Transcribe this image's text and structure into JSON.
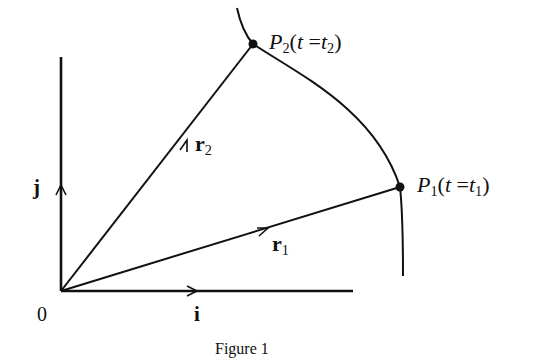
{
  "figure": {
    "caption": "Figure 1",
    "origin_label": "0",
    "x_unit_label": "i",
    "y_unit_label": "j",
    "vectors": [
      {
        "name": "r",
        "sub": "1"
      },
      {
        "name": "r",
        "sub": "2"
      }
    ],
    "points": [
      {
        "name": "P",
        "sub": "1",
        "param": "t",
        "eq": " =",
        "value": "t",
        "value_sub": "1"
      },
      {
        "name": "P",
        "sub": "2",
        "param": "t",
        "eq": " =",
        "value": "t",
        "value_sub": "2"
      }
    ],
    "colors": {
      "ink": "#111111",
      "background": "#ffffff"
    }
  }
}
